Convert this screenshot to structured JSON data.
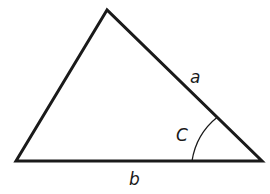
{
  "diagram": {
    "type": "triangle",
    "stroke_color": "#1a1a1a",
    "background": "#ffffff",
    "vertices": {
      "top": [
        107,
        10
      ],
      "bottom_left": [
        16,
        161
      ],
      "bottom_right": [
        262,
        161
      ]
    },
    "labels": {
      "side_a": "a",
      "side_b": "b",
      "angle_c": "C"
    },
    "angle_arc": {
      "vertex": "bottom_right",
      "radius": 70
    }
  }
}
